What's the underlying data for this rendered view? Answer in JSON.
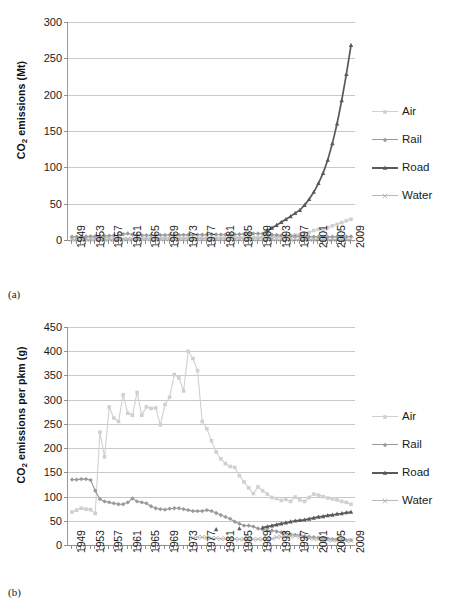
{
  "figure": {
    "panels": [
      {
        "caption": "(a)",
        "ylabel_pre": "CO",
        "ylabel_sub": "2",
        "ylabel_post": " emissions (Mt)"
      },
      {
        "caption": "(b)",
        "ylabel_pre": "CO",
        "ylabel_sub": "2",
        "ylabel_post": " emissions  per pkm (g)"
      }
    ],
    "legend": {
      "items": [
        {
          "label": "Air",
          "color": "#d0d0d0",
          "marker": "square"
        },
        {
          "label": "Rail",
          "color": "#9a9a9a",
          "marker": "diamond"
        },
        {
          "label": "Road",
          "color": "#5a5a5a",
          "marker": "triangle"
        },
        {
          "label": "Water",
          "color": "#b8b8b8",
          "marker": "cross"
        }
      ]
    }
  },
  "chart_data": [
    {
      "type": "line",
      "title": "",
      "panel": "(a)",
      "xlabel": "",
      "ylabel": "CO2 emissions (Mt)",
      "ylim": [
        0,
        300
      ],
      "yticks": [
        0,
        50,
        100,
        150,
        200,
        250,
        300
      ],
      "xlim": [
        1949,
        2009
      ],
      "xticks": [
        1949,
        1953,
        1957,
        1961,
        1965,
        1969,
        1973,
        1977,
        1981,
        1985,
        1989,
        1993,
        1997,
        2001,
        2005,
        2009
      ],
      "grid": true,
      "legend_position": "right",
      "x": [
        1949,
        1950,
        1951,
        1952,
        1953,
        1954,
        1955,
        1956,
        1957,
        1958,
        1959,
        1960,
        1961,
        1962,
        1963,
        1964,
        1965,
        1966,
        1967,
        1968,
        1969,
        1970,
        1971,
        1972,
        1973,
        1974,
        1975,
        1976,
        1977,
        1978,
        1979,
        1980,
        1981,
        1982,
        1983,
        1984,
        1985,
        1986,
        1987,
        1988,
        1989,
        1990,
        1991,
        1992,
        1993,
        1994,
        1995,
        1996,
        1997,
        1998,
        1999,
        2000,
        2001,
        2002,
        2003,
        2004,
        2005,
        2006,
        2007,
        2008,
        2009
      ],
      "series": [
        {
          "name": "Air",
          "color": "#d0d0d0",
          "values": [
            0.2,
            0.2,
            0.3,
            0.3,
            0.4,
            0.4,
            0.5,
            0.5,
            0.6,
            0.6,
            0.7,
            0.8,
            0.9,
            0.9,
            1.0,
            1.1,
            1.2,
            1.3,
            1.4,
            1.5,
            1.6,
            1.7,
            1.8,
            1.9,
            2.0,
            2.0,
            2.0,
            2.1,
            2.2,
            2.3,
            2.4,
            2.4,
            2.4,
            2.5,
            2.6,
            2.7,
            2.9,
            3.0,
            3.2,
            3.4,
            3.6,
            3.9,
            4.0,
            4.3,
            4.8,
            5.3,
            5.8,
            6.4,
            7.0,
            7.8,
            8.8,
            10.5,
            13.0,
            14.5,
            15.0,
            17.0,
            19.5,
            21.5,
            24.0,
            26.5,
            28.5
          ]
        },
        {
          "name": "Rail",
          "color": "#9a9a9a",
          "values": [
            4.5,
            4.6,
            4.7,
            4.9,
            5.0,
            5.2,
            5.4,
            5.6,
            5.9,
            6.2,
            6.6,
            8.0,
            9.0,
            7.4,
            6.7,
            6.6,
            6.6,
            6.6,
            6.6,
            6.7,
            6.8,
            6.9,
            6.9,
            7.0,
            7.1,
            7.1,
            7.1,
            7.2,
            7.3,
            7.4,
            7.5,
            7.5,
            7.4,
            7.4,
            7.5,
            7.7,
            8.0,
            8.2,
            8.5,
            8.8,
            9.0,
            8.8,
            8.0,
            7.3,
            6.8,
            6.3,
            5.9,
            5.6,
            5.3,
            5.0,
            4.7,
            4.5,
            4.4,
            4.3,
            4.3,
            4.3,
            4.4,
            4.5,
            4.6,
            4.7,
            4.8
          ]
        },
        {
          "name": "Road",
          "color": "#5a5a5a",
          "values": [
            null,
            null,
            null,
            null,
            null,
            null,
            null,
            null,
            null,
            null,
            null,
            null,
            null,
            null,
            null,
            null,
            null,
            null,
            null,
            null,
            null,
            null,
            null,
            null,
            null,
            null,
            null,
            null,
            null,
            null,
            null,
            null,
            null,
            null,
            null,
            null,
            null,
            null,
            null,
            null,
            null,
            null,
            13.0,
            16.5,
            20.5,
            24.5,
            28.5,
            32.5,
            37.0,
            41.0,
            48.0,
            56.0,
            66.0,
            78.0,
            92.0,
            110.0,
            133.0,
            160.0,
            192.0,
            228.0,
            268.0
          ]
        },
        {
          "name": "Water",
          "color": "#b8b8b8",
          "values": [
            1.0,
            1.0,
            1.0,
            1.0,
            1.0,
            1.0,
            1.1,
            1.1,
            1.1,
            1.1,
            1.2,
            1.2,
            1.2,
            1.2,
            1.2,
            1.3,
            1.3,
            1.3,
            1.3,
            1.3,
            1.4,
            1.4,
            1.4,
            1.4,
            1.4,
            1.4,
            1.4,
            1.4,
            1.4,
            1.4,
            1.4,
            1.4,
            1.3,
            1.3,
            1.3,
            1.3,
            1.3,
            1.3,
            1.3,
            1.3,
            1.3,
            1.3,
            1.2,
            1.2,
            1.1,
            1.1,
            1.0,
            1.0,
            1.0,
            0.9,
            0.9,
            0.9,
            0.8,
            0.8,
            0.8,
            0.7,
            0.7,
            0.7,
            0.6,
            0.6,
            0.6
          ]
        }
      ]
    },
    {
      "type": "line",
      "title": "",
      "panel": "(b)",
      "xlabel": "",
      "ylabel": "CO2 emissions per pkm (g)",
      "ylim": [
        0,
        450
      ],
      "yticks": [
        0,
        50,
        100,
        150,
        200,
        250,
        300,
        350,
        400,
        450
      ],
      "xlim": [
        1949,
        2009
      ],
      "xticks": [
        1949,
        1953,
        1957,
        1961,
        1965,
        1969,
        1973,
        1977,
        1981,
        1985,
        1989,
        1993,
        1997,
        2001,
        2005,
        2009
      ],
      "grid": true,
      "legend_position": "right",
      "x": [
        1949,
        1950,
        1951,
        1952,
        1953,
        1954,
        1955,
        1956,
        1957,
        1958,
        1959,
        1960,
        1961,
        1962,
        1963,
        1964,
        1965,
        1966,
        1967,
        1968,
        1969,
        1970,
        1971,
        1972,
        1973,
        1974,
        1975,
        1976,
        1977,
        1978,
        1979,
        1980,
        1981,
        1982,
        1983,
        1984,
        1985,
        1986,
        1987,
        1988,
        1989,
        1990,
        1991,
        1992,
        1993,
        1994,
        1995,
        1996,
        1997,
        1998,
        1999,
        2000,
        2001,
        2002,
        2003,
        2004,
        2005,
        2006,
        2007,
        2008,
        2009
      ],
      "series": [
        {
          "name": "Air",
          "color": "#d0d0d0",
          "values": [
            68,
            72,
            76,
            74,
            73,
            65,
            233,
            182,
            285,
            262,
            255,
            310,
            272,
            268,
            315,
            268,
            285,
            282,
            283,
            248,
            290,
            305,
            352,
            345,
            318,
            400,
            385,
            360,
            255,
            240,
            215,
            192,
            178,
            168,
            162,
            160,
            143,
            130,
            118,
            106,
            120,
            112,
            105,
            98,
            96,
            92,
            94,
            90,
            99,
            93,
            90,
            98,
            105,
            103,
            100,
            97,
            95,
            93,
            90,
            88,
            84
          ]
        },
        {
          "name": "Rail",
          "color": "#9a9a9a",
          "values": [
            135,
            135,
            136,
            136,
            134,
            112,
            95,
            90,
            88,
            86,
            84,
            84,
            88,
            96,
            90,
            88,
            86,
            80,
            76,
            74,
            73,
            75,
            76,
            76,
            74,
            72,
            70,
            70,
            70,
            72,
            70,
            66,
            62,
            58,
            54,
            48,
            44,
            40,
            40,
            38,
            34,
            32,
            30,
            30,
            28,
            26,
            24,
            22,
            21,
            20,
            18,
            17,
            16,
            15,
            14,
            13,
            12,
            11,
            11,
            10,
            10
          ]
        },
        {
          "name": "Road",
          "color": "#5a5a5a",
          "values": [
            null,
            null,
            null,
            null,
            null,
            null,
            null,
            null,
            null,
            null,
            null,
            null,
            null,
            null,
            null,
            null,
            null,
            null,
            null,
            null,
            null,
            null,
            null,
            null,
            null,
            null,
            null,
            null,
            null,
            null,
            null,
            32,
            null,
            null,
            null,
            null,
            34,
            null,
            null,
            null,
            null,
            36,
            38,
            40,
            42,
            44,
            46,
            48,
            50,
            51,
            52,
            54,
            56,
            58,
            59,
            61,
            62,
            64,
            65,
            67,
            68
          ]
        },
        {
          "name": "Water",
          "color": "#b8b8b8",
          "values": [
            null,
            null,
            null,
            null,
            null,
            null,
            null,
            null,
            null,
            null,
            null,
            null,
            null,
            null,
            null,
            null,
            null,
            null,
            null,
            null,
            null,
            null,
            null,
            null,
            null,
            null,
            15,
            16,
            16,
            15,
            14,
            14,
            13,
            13,
            13,
            12,
            12,
            12,
            12,
            12,
            12,
            12,
            12,
            13,
            16,
            17,
            17,
            18,
            19,
            17,
            15,
            14,
            13,
            12,
            12,
            11,
            10,
            10,
            10,
            9,
            9
          ]
        }
      ]
    }
  ]
}
